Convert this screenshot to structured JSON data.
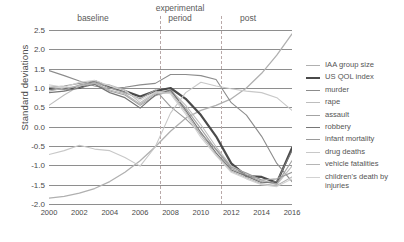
{
  "chart_data": {
    "type": "line",
    "title": "",
    "xlabel": "",
    "ylabel": "Standard deviations",
    "xlim": [
      2000,
      2016
    ],
    "ylim": [
      -2.0,
      2.5
    ],
    "yticks": [
      "2.5",
      "2.0",
      "1.5",
      "1.0",
      "0.5",
      "0.0",
      "-0.5",
      "-1.0",
      "-1.5",
      "-2.0"
    ],
    "ytick_values": [
      2.5,
      2.0,
      1.5,
      1.0,
      0.5,
      0.0,
      -0.5,
      -1.0,
      -1.5,
      -2.0
    ],
    "xticks": [
      "2000",
      "2002",
      "2004",
      "2006",
      "2008",
      "2010",
      "2012",
      "2014",
      "2016"
    ],
    "xtick_values": [
      2000,
      2002,
      2004,
      2006,
      2008,
      2010,
      2012,
      2014,
      2016
    ],
    "grid": "horizontal",
    "legend_position": "right",
    "x": [
      2000,
      2001,
      2002,
      2003,
      2004,
      2005,
      2006,
      2007,
      2008,
      2009,
      2010,
      2011,
      2012,
      2013,
      2014,
      2015,
      2016
    ],
    "annotations": [
      {
        "label": "baseline",
        "x_center": 2003.0
      },
      {
        "label": "experimental period",
        "x_center": 2009.3
      },
      {
        "label": "post",
        "x_center": 2014.3
      }
    ],
    "dividers": [
      {
        "x": 2007.3,
        "style": "dashed"
      },
      {
        "x": 2011.3,
        "style": "dashed"
      }
    ],
    "series": [
      {
        "name": "IAA group size",
        "color": "#b0b0b0",
        "width": 1.3,
        "values": [
          -1.85,
          -1.8,
          -1.72,
          -1.6,
          -1.42,
          -1.18,
          -0.88,
          -0.52,
          -0.12,
          0.22,
          0.42,
          0.55,
          0.72,
          1.0,
          1.38,
          1.85,
          2.4
        ]
      },
      {
        "name": "US QOL index",
        "color": "#4a4a4a",
        "width": 2.2,
        "values": [
          0.98,
          0.98,
          1.0,
          1.18,
          1.02,
          0.92,
          0.78,
          0.92,
          1.0,
          0.72,
          0.3,
          -0.25,
          -0.95,
          -1.28,
          -1.3,
          -1.45,
          -0.55
        ]
      },
      {
        "name": "murder",
        "color": "#8c8c8c",
        "width": 1.1,
        "values": [
          1.45,
          1.32,
          1.18,
          1.05,
          0.98,
          1.02,
          1.08,
          1.12,
          1.35,
          1.35,
          1.32,
          1.22,
          0.62,
          0.3,
          -0.25,
          -0.95,
          -1.42
        ]
      },
      {
        "name": "rape",
        "color": "#bdbdbd",
        "width": 1.1,
        "values": [
          0.55,
          0.82,
          1.05,
          1.12,
          1.08,
          0.95,
          0.62,
          0.88,
          0.95,
          0.55,
          0.05,
          -0.52,
          -1.02,
          -1.22,
          -1.38,
          -1.5,
          -1.02
        ]
      },
      {
        "name": "assault",
        "color": "#a3a3a3",
        "width": 1.1,
        "values": [
          1.02,
          0.95,
          1.08,
          1.15,
          0.92,
          0.82,
          0.55,
          0.8,
          0.92,
          0.48,
          -0.05,
          -0.6,
          -1.08,
          -1.25,
          -1.42,
          -1.48,
          -0.88
        ]
      },
      {
        "name": "robbery",
        "color": "#767676",
        "width": 1.2,
        "values": [
          0.88,
          0.92,
          1.0,
          1.1,
          0.88,
          0.75,
          0.48,
          0.82,
          0.95,
          0.42,
          -0.15,
          -0.68,
          -1.12,
          -1.28,
          -1.45,
          -1.42,
          -0.62
        ]
      },
      {
        "name": "infant mortality",
        "color": "#9a9a9a",
        "width": 1.1,
        "values": [
          1.02,
          1.05,
          1.12,
          1.18,
          1.0,
          0.88,
          0.72,
          0.95,
          0.52,
          0.2,
          -0.18,
          -0.58,
          -1.05,
          -1.2,
          -1.38,
          -1.35,
          -1.18
        ]
      },
      {
        "name": "drug deaths",
        "color": "#c8c8c8",
        "width": 1.1,
        "values": [
          -0.72,
          -0.62,
          -0.48,
          -0.58,
          -0.62,
          -0.8,
          -1.02,
          -0.52,
          0.35,
          0.88,
          1.15,
          1.05,
          0.98,
          0.92,
          0.88,
          0.75,
          0.42
        ]
      },
      {
        "name": "vehicle fatalities",
        "color": "#b5b5b5",
        "width": 1.1,
        "values": [
          0.92,
          1.0,
          1.05,
          1.12,
          0.95,
          0.85,
          0.58,
          0.85,
          0.88,
          0.38,
          -0.22,
          -0.72,
          -1.15,
          -1.32,
          -1.48,
          -1.52,
          -1.3
        ]
      },
      {
        "name": "children's death by injuries",
        "color": "#d2d2d2",
        "width": 1.1,
        "values": [
          1.08,
          1.02,
          1.15,
          1.2,
          1.05,
          0.92,
          0.68,
          0.9,
          0.85,
          0.32,
          -0.28,
          -0.75,
          -1.18,
          -1.35,
          -1.5,
          -1.55,
          -1.35
        ]
      }
    ]
  }
}
